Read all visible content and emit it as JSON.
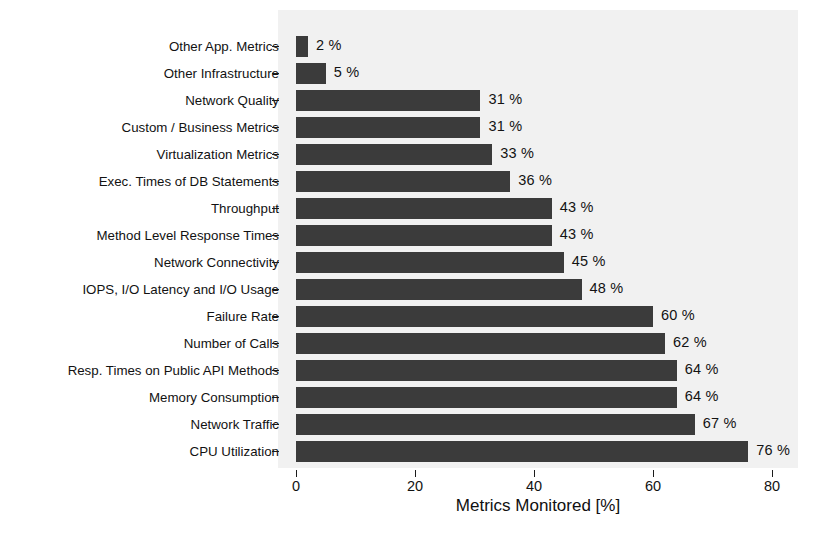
{
  "chart_data": {
    "type": "bar",
    "orientation": "horizontal",
    "title": "",
    "xlabel": "Metrics Monitored [%]",
    "ylabel": "",
    "xlim": [
      0,
      84
    ],
    "xticks": [
      0,
      20,
      40,
      60,
      80
    ],
    "xtick_labels": [
      "0",
      "20",
      "40",
      "60",
      "80"
    ],
    "grid": false,
    "legend": false,
    "bar_color": "#3b3b3b",
    "panel_color": "#f1f1f1",
    "value_suffix": " %",
    "categories": [
      "Other App. Metrics",
      "Other Infrastructure",
      "Network Quality",
      "Custom / Business Metrics",
      "Virtualization Metrics",
      "Exec. Times of DB Statements",
      "Throughput",
      "Method Level Response Times",
      "Network Connectivity",
      "IOPS, I/O Latency and I/O Usage",
      "Failure Rate",
      "Number of Calls",
      "Resp. Times on Public API Methods",
      "Memory Consumption",
      "Network Traffic",
      "CPU Utilization"
    ],
    "values": [
      2,
      5,
      31,
      31,
      33,
      36,
      43,
      43,
      45,
      48,
      60,
      62,
      64,
      64,
      67,
      76
    ],
    "value_labels": [
      "2 %",
      "5 %",
      "31 %",
      "31 %",
      "33 %",
      "36 %",
      "43 %",
      "43 %",
      "45 %",
      "48 %",
      "60 %",
      "62 %",
      "64 %",
      "64 %",
      "67 %",
      "76 %"
    ]
  }
}
